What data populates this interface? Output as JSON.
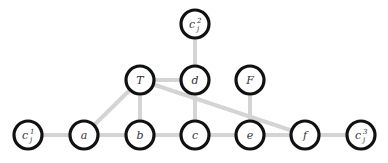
{
  "diagram": {
    "nodes": [
      {
        "id": "c2",
        "label": "c",
        "sub": "j",
        "sup": "2",
        "x": 195,
        "y": 24
      },
      {
        "id": "T",
        "label": "T",
        "x": 140,
        "y": 80
      },
      {
        "id": "d",
        "label": "d",
        "x": 195,
        "y": 80
      },
      {
        "id": "F",
        "label": "F",
        "x": 250,
        "y": 80
      },
      {
        "id": "c1",
        "label": "c",
        "sub": "j",
        "sup": "1",
        "x": 28,
        "y": 135
      },
      {
        "id": "a",
        "label": "a",
        "x": 84,
        "y": 135
      },
      {
        "id": "b",
        "label": "b",
        "x": 140,
        "y": 135
      },
      {
        "id": "c",
        "label": "c",
        "x": 195,
        "y": 135
      },
      {
        "id": "e",
        "label": "e",
        "x": 250,
        "y": 135
      },
      {
        "id": "f",
        "label": "f",
        "x": 305,
        "y": 135
      },
      {
        "id": "c3",
        "label": "c",
        "sub": "j",
        "sup": "3",
        "x": 361,
        "y": 135
      }
    ],
    "edges": [
      [
        "c2",
        "d"
      ],
      [
        "T",
        "d"
      ],
      [
        "T",
        "a"
      ],
      [
        "T",
        "b"
      ],
      [
        "T",
        "f"
      ],
      [
        "d",
        "c"
      ],
      [
        "F",
        "e"
      ],
      [
        "c1",
        "a"
      ],
      [
        "a",
        "b"
      ],
      [
        "b",
        "c"
      ],
      [
        "c",
        "e"
      ],
      [
        "e",
        "f"
      ],
      [
        "f",
        "c3"
      ]
    ],
    "colors": {
      "edge": "#d4d4d4",
      "node_stroke": "#111111",
      "node_fill": "#ffffff"
    }
  }
}
